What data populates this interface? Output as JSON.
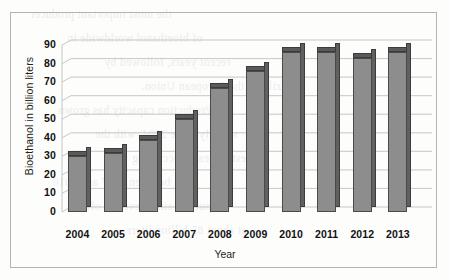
{
  "figure": {
    "frame_border_color": "#b4b4b4",
    "background_color": "#fdfdfc"
  },
  "bleed_text": {
    "lines": [
      "the most important producer",
      "of bioethanol worldwide in",
      "recent years, followed by",
      "Brazil and the European Union.",
      "Production capacity has grown",
      "steadily since 2004, with the",
      "largest increases occurring",
      "between 2007 and 2010.",
      "Output has since levelled off",
      "at about 85 billion liters."
    ]
  },
  "chart_data": {
    "type": "bar",
    "title": "",
    "xlabel": "Year",
    "ylabel": "Bioethanol in billion liters",
    "categories": [
      "2004",
      "2005",
      "2006",
      "2007",
      "2008",
      "2009",
      "2010",
      "2011",
      "2012",
      "2013"
    ],
    "values": [
      30,
      32,
      39,
      50,
      67,
      76,
      86,
      86,
      83,
      86
    ],
    "ylim": [
      0,
      90
    ],
    "ytick_values": [
      "0",
      "10",
      "20",
      "30",
      "40",
      "50",
      "60",
      "70",
      "80",
      "90"
    ],
    "ytick_step": 10,
    "grid": true,
    "grid_style": "3d-slanted-horizontal",
    "legend": "none",
    "series_name": "Bioethanol production",
    "bar_colors": {
      "front": "#8d8d8d",
      "side": "#606060",
      "top": "#5a5a5a",
      "outline": "#4a4a4a"
    }
  }
}
